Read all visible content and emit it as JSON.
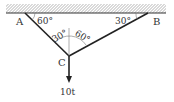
{
  "diagram": {
    "points": {
      "A": "A",
      "B": "B",
      "C": "C"
    },
    "angles": {
      "at_A": "60°",
      "at_B": "30°",
      "at_C_left": "30°",
      "at_C_right": "60°"
    },
    "load": "10t",
    "colors": {
      "line": "#222222",
      "hatch": "#555555",
      "text": "#333333"
    }
  }
}
